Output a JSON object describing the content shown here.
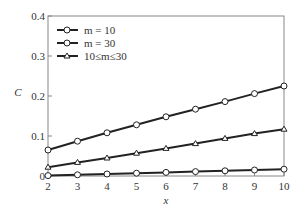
{
  "chart_data": {
    "type": "line",
    "title": "",
    "xlabel": "x",
    "ylabel": "C",
    "x": [
      2,
      3,
      4,
      5,
      6,
      7,
      8,
      9,
      10
    ],
    "xlim": [
      2,
      10
    ],
    "ylim": [
      0,
      0.4
    ],
    "xticks": [
      "2",
      "3",
      "4",
      "5",
      "6",
      "7",
      "8",
      "9",
      "10"
    ],
    "yticks": [
      "0",
      "0.1",
      "0.2",
      "0.3",
      "0.4"
    ],
    "grid": false,
    "legend_position": "upper left",
    "series": [
      {
        "name": "m = 10",
        "marker": "circle",
        "values": [
          0.001,
          0.003,
          0.005,
          0.007,
          0.009,
          0.011,
          0.013,
          0.015,
          0.017
        ]
      },
      {
        "name": "m = 30",
        "marker": "circle",
        "values": [
          0.065,
          0.087,
          0.108,
          0.128,
          0.148,
          0.167,
          0.186,
          0.206,
          0.225
        ]
      },
      {
        "name": "10≤m≤30",
        "marker": "triangle",
        "values": [
          0.022,
          0.034,
          0.045,
          0.057,
          0.069,
          0.081,
          0.094,
          0.106,
          0.117
        ]
      }
    ]
  }
}
